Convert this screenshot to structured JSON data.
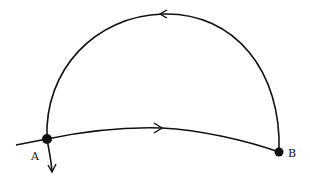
{
  "diagram": {
    "type": "path-diagram",
    "colors": {
      "stroke": "#111111",
      "background": "#ffffff"
    },
    "points": [
      {
        "id": "A",
        "label": "A",
        "x": 47,
        "y": 139
      },
      {
        "id": "B",
        "label": "B",
        "x": 279,
        "y": 152
      }
    ],
    "paths": [
      {
        "id": "upper-arc",
        "from": "A",
        "to": "B",
        "direction_arrow": "leftward at top",
        "shape": "large semicircular arc above"
      },
      {
        "id": "lower-curve",
        "from": "A",
        "to": "B",
        "direction_arrow": "rightward at middle",
        "shape": "shallow upward-bulging curve"
      },
      {
        "id": "exit-arrow",
        "from": "A",
        "direction": "downward"
      }
    ]
  }
}
